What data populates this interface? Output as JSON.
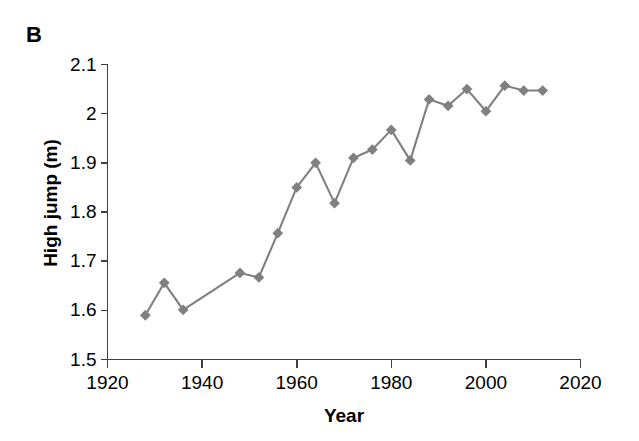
{
  "panel": {
    "label": "B"
  },
  "chart_data": {
    "type": "line",
    "title": "",
    "xlabel": "Year",
    "ylabel": "High jump (m)",
    "xlim": [
      1920,
      2020
    ],
    "ylim": [
      1.5,
      2.1
    ],
    "xticks": [
      1920,
      1940,
      1960,
      1980,
      2000,
      2020
    ],
    "xtick_labels": [
      "1920",
      "1940",
      "1960",
      "1980",
      "2000",
      "2020"
    ],
    "yticks": [
      1.5,
      1.6,
      1.7,
      1.8,
      1.9,
      2.0,
      2.1
    ],
    "ytick_labels": [
      "1.5",
      "1.6",
      "1.7",
      "1.8",
      "1.9",
      "2",
      "2.1"
    ],
    "grid": false,
    "legend": null,
    "series": [
      {
        "name": "High jump world record",
        "color": "#808080",
        "marker": "diamond",
        "x": [
          1928,
          1932,
          1936,
          1948,
          1952,
          1956,
          1960,
          1964,
          1968,
          1972,
          1976,
          1980,
          1984,
          1988,
          1992,
          1996,
          2000,
          2004,
          2008,
          2012
        ],
        "y": [
          1.59,
          1.656,
          1.601,
          1.676,
          1.667,
          1.757,
          1.85,
          1.9,
          1.818,
          1.91,
          1.927,
          1.967,
          1.905,
          2.029,
          2.016,
          2.05,
          2.005,
          2.057,
          2.047,
          2.047
        ]
      }
    ]
  },
  "colors": {
    "series": "#808080",
    "axis": "#404040",
    "text": "#000000",
    "background": "#ffffff"
  }
}
